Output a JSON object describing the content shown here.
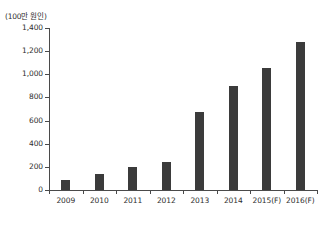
{
  "chart_data": {
    "type": "bar",
    "title": "",
    "subtitle": "",
    "unit_label": "(100만 원인)",
    "xlabel": "",
    "ylabel": "",
    "categories": [
      "2009",
      "2010",
      "2011",
      "2012",
      "2013",
      "2014",
      "2015(F)",
      "2016(F)"
    ],
    "values": [
      85,
      140,
      200,
      245,
      675,
      900,
      1055,
      1280
    ],
    "series": [
      {
        "name": "",
        "values": [
          85,
          140,
          200,
          245,
          675,
          900,
          1055,
          1280
        ]
      }
    ],
    "ylim": [
      0,
      1400
    ],
    "yticks": [
      0,
      200,
      400,
      600,
      800,
      1000,
      1200,
      1400
    ],
    "ytick_labels": [
      "0",
      "200",
      "400",
      "600",
      "800",
      "1,000",
      "1,200",
      "1,400"
    ],
    "grid": false,
    "legend": false,
    "legend_position": "none",
    "bar_color": "#3b3b3b",
    "axis_color": "#4a4a4a",
    "background_color": "#ffffff",
    "annotations": []
  }
}
